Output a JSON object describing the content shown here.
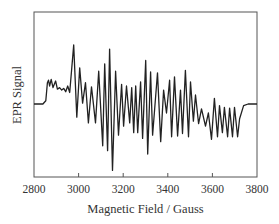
{
  "chart_data": {
    "type": "line",
    "title": "",
    "xlabel": "Magnetic Field / Gauss",
    "ylabel": "EPR Signal",
    "xlim": [
      2800,
      3800
    ],
    "ylim": [
      -1,
      1
    ],
    "grid": false,
    "legend": null,
    "x_ticks": [
      2800,
      3000,
      3200,
      3400,
      3600,
      3800
    ],
    "x_tick_labels": [
      "2800",
      "3000",
      "3200",
      "3400",
      "3600",
      "3800"
    ],
    "y_ticks": [],
    "series": [
      {
        "name": "EPR Signal",
        "color": "#222222",
        "points": [
          [
            2800,
            0.0
          ],
          [
            2840,
            0.0
          ],
          [
            2853,
            0.04
          ],
          [
            2860,
            0.26
          ],
          [
            2865,
            0.29
          ],
          [
            2870,
            0.22
          ],
          [
            2877,
            0.3
          ],
          [
            2885,
            0.2
          ],
          [
            2897,
            0.28
          ],
          [
            2905,
            0.18
          ],
          [
            2915,
            0.2
          ],
          [
            2924,
            0.17
          ],
          [
            2933,
            0.19
          ],
          [
            2942,
            0.15
          ],
          [
            2951,
            0.22
          ],
          [
            2960,
            0.14
          ],
          [
            2978,
            0.72
          ],
          [
            2992,
            -0.16
          ],
          [
            3005,
            0.44
          ],
          [
            3018,
            0.01
          ],
          [
            3031,
            0.26
          ],
          [
            3044,
            -0.23
          ],
          [
            3058,
            0.21
          ],
          [
            3076,
            -0.23
          ],
          [
            3090,
            0.4
          ],
          [
            3108,
            -0.51
          ],
          [
            3117,
            0.49
          ],
          [
            3130,
            -0.57
          ],
          [
            3139,
            0.67
          ],
          [
            3152,
            -0.81
          ],
          [
            3166,
            0.4
          ],
          [
            3179,
            -0.38
          ],
          [
            3193,
            0.24
          ],
          [
            3202,
            -0.27
          ],
          [
            3215,
            0.22
          ],
          [
            3229,
            -0.23
          ],
          [
            3238,
            0.2
          ],
          [
            3247,
            -0.35
          ],
          [
            3256,
            0.22
          ],
          [
            3265,
            -0.35
          ],
          [
            3278,
            0.27
          ],
          [
            3287,
            -0.42
          ],
          [
            3301,
            0.53
          ],
          [
            3310,
            -0.61
          ],
          [
            3323,
            0.39
          ],
          [
            3332,
            -0.38
          ],
          [
            3354,
            0.38
          ],
          [
            3368,
            -0.46
          ],
          [
            3381,
            0.17
          ],
          [
            3394,
            -0.11
          ],
          [
            3408,
            0.29
          ],
          [
            3417,
            -0.4
          ],
          [
            3430,
            0.33
          ],
          [
            3444,
            -0.39
          ],
          [
            3457,
            0.17
          ],
          [
            3466,
            -0.36
          ],
          [
            3479,
            0.41
          ],
          [
            3493,
            -0.4
          ],
          [
            3502,
            0.27
          ],
          [
            3515,
            -0.21
          ],
          [
            3524,
            0.11
          ],
          [
            3538,
            -0.24
          ],
          [
            3551,
            -0.06
          ],
          [
            3569,
            -0.27
          ],
          [
            3582,
            -0.11
          ],
          [
            3596,
            -0.43
          ],
          [
            3609,
            0.07
          ],
          [
            3623,
            -0.4
          ],
          [
            3632,
            -0.02
          ],
          [
            3645,
            -0.35
          ],
          [
            3654,
            -0.04
          ],
          [
            3668,
            -0.4
          ],
          [
            3677,
            -0.05
          ],
          [
            3690,
            -0.4
          ],
          [
            3699,
            -0.04
          ],
          [
            3713,
            -0.4
          ],
          [
            3722,
            -0.18
          ],
          [
            3740,
            -0.02
          ],
          [
            3760,
            0.0
          ],
          [
            3800,
            0.0
          ]
        ]
      }
    ]
  }
}
